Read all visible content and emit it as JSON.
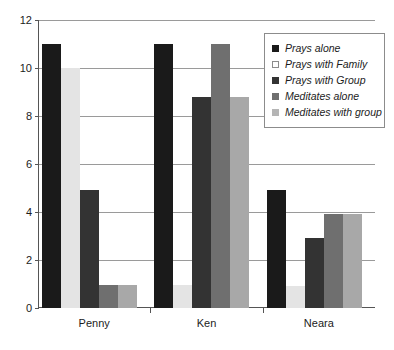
{
  "chart_data": {
    "type": "bar",
    "title": "",
    "xlabel": "",
    "ylabel": "",
    "ylim": [
      0,
      12
    ],
    "ytick_step": 2,
    "yticks": [
      0,
      2,
      4,
      6,
      8,
      10,
      12
    ],
    "ytick_labels": [
      "0",
      "2",
      "4",
      "6",
      "8",
      "10",
      "12"
    ],
    "categories": [
      "Penny",
      "Ken",
      "Neara"
    ],
    "grid": true,
    "legend_position": "top-right",
    "series": [
      {
        "name": "Prays alone",
        "color": "#1a1a1a",
        "values": [
          11,
          11,
          4.9
        ]
      },
      {
        "name": "Prays with Family",
        "color": "#e4e4e4",
        "values": [
          10,
          0.95,
          0.9
        ]
      },
      {
        "name": "Prays with Group",
        "color": "#333333",
        "values": [
          4.9,
          8.8,
          2.9
        ]
      },
      {
        "name": "Meditates alone",
        "color": "#6f6f6f",
        "values": [
          0.95,
          11,
          3.9
        ]
      },
      {
        "name": "Meditates with group",
        "color": "#a8a8a8",
        "values": [
          0.95,
          8.8,
          3.9
        ]
      }
    ]
  }
}
